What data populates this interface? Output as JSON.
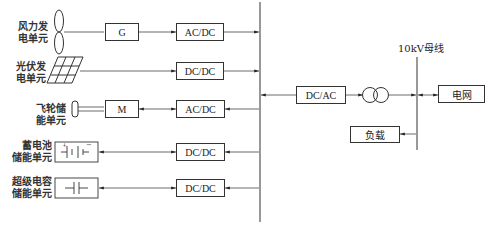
{
  "diagram": {
    "title": "",
    "sources": [
      {
        "label_line1": "风力发",
        "label_line2": "电单元",
        "device": "G",
        "converter": "AC/DC"
      },
      {
        "label_line1": "光伏发",
        "label_line2": "电单元",
        "converter": "DC/DC"
      },
      {
        "label_line1": "飞轮储",
        "label_line2": "能单元",
        "device": "M",
        "converter": "AC/DC"
      },
      {
        "label_line1": "蓄电池",
        "label_line2": "储能单元",
        "converter": "DC/DC"
      },
      {
        "label_line1": "超级电容",
        "label_line2": "储能单元",
        "converter": "DC/DC"
      }
    ],
    "inverter": "DC/AC",
    "bus_label": "10kV母线",
    "grid": "电网",
    "load": "负载"
  }
}
